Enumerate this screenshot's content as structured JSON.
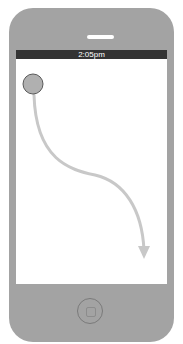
{
  "device": {
    "type": "phone-mockup",
    "body_color": "#a3a3a3",
    "screen_color": "#ffffff"
  },
  "status_bar": {
    "time": "2:05pm",
    "background": "#333333"
  },
  "gesture": {
    "type": "swipe-down-curve",
    "start_circle": {
      "cx": 33,
      "cy": 84,
      "r": 10,
      "fill": "#b0b0b0"
    },
    "arrow_color": "#c8c8c8",
    "arrow_tip": {
      "x": 144,
      "y": 258
    }
  },
  "icons": {
    "speaker": "speaker-slot-icon",
    "home": "home-button-icon",
    "touch": "touch-point-icon",
    "arrow": "swipe-arrow-icon"
  }
}
